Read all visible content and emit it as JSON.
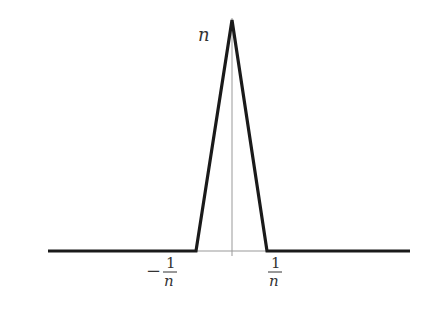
{
  "diagram": {
    "type": "function-plot",
    "labels": {
      "peak": "n",
      "left_tick_sign": "−",
      "left_tick_num": "1",
      "left_tick_den": "n",
      "right_tick_num": "1",
      "right_tick_den": "n"
    },
    "colors": {
      "curve": "#1a1a1a",
      "axis": "#999999",
      "text": "#333333"
    }
  }
}
